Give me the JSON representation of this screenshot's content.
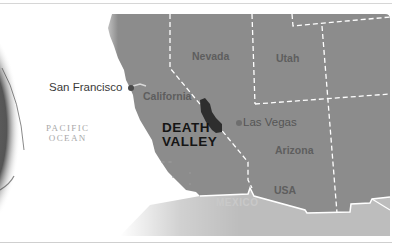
{
  "map": {
    "title": "Death Valley location map",
    "highlight": {
      "label_line1": "DEATH",
      "label_line2": "VALLEY"
    },
    "cities": [
      {
        "name": "San Francisco"
      },
      {
        "name": "Las Vegas"
      }
    ],
    "states": [
      {
        "name": "Nevada"
      },
      {
        "name": "Utah"
      },
      {
        "name": "California"
      },
      {
        "name": "Arizona"
      }
    ],
    "country": "USA",
    "neighbor_country": "MEXICO",
    "ocean": {
      "line1": "PACIFIC",
      "line2": "OCEAN"
    },
    "colors": {
      "land_usa": "#8c8c8c",
      "land_mexico": "#bdbdbd",
      "death_valley": "#2e2e2e",
      "borders": "#ffffff",
      "city_dot": "#4a4a4a"
    }
  }
}
